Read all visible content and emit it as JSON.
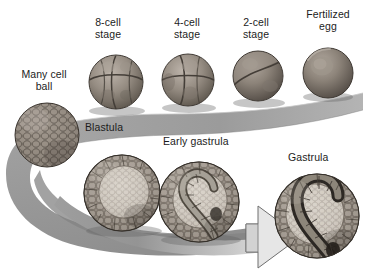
{
  "figure": {
    "background_color": "#ffffff",
    "ink_color": "#1c1c1c",
    "ribbon_color": "#9a9a9a",
    "ribbon_shadow_color": "#7d7d7d",
    "embryo_fill": "#8b8179",
    "embryo_dark": "#5d564f",
    "embryo_light": "#c3bcb3"
  },
  "labels": {
    "eight_cell": "8-cell\nstage",
    "four_cell": "4-cell\nstage",
    "two_cell": "2-cell\nstage",
    "fertilized_egg": "Fertilized\negg",
    "many_cell_ball": "Many cell\nball",
    "blastula": "Blastula",
    "early_gastrula": "Early gastrula",
    "gastrula": "Gastrula"
  },
  "stages": [
    {
      "key": "fertilized_egg",
      "label": "Fertilized egg",
      "order": 1,
      "cells": 1,
      "type": "single-sphere"
    },
    {
      "key": "two_cell",
      "label": "2-cell stage",
      "order": 2,
      "cells": 2,
      "type": "cleavage"
    },
    {
      "key": "four_cell",
      "label": "4-cell stage",
      "order": 3,
      "cells": 4,
      "type": "cleavage"
    },
    {
      "key": "eight_cell",
      "label": "8-cell stage",
      "order": 4,
      "cells": 8,
      "type": "cleavage"
    },
    {
      "key": "many_cell_ball",
      "label": "Many cell ball",
      "order": 5,
      "cells": 64,
      "type": "morula"
    },
    {
      "key": "blastula",
      "label": "Blastula",
      "order": 6,
      "cells": 128,
      "type": "hollow-sphere"
    },
    {
      "key": "early_gastrula",
      "label": "Early gastrula",
      "order": 7,
      "cells": 200,
      "type": "invaginating"
    },
    {
      "key": "gastrula",
      "label": "Gastrula",
      "order": 8,
      "cells": 300,
      "type": "gastrula-section"
    }
  ],
  "flow": {
    "direction": "right-to-left-then-left-to-right",
    "arrow_head": "right",
    "shape": "s-curve-ribbon"
  }
}
